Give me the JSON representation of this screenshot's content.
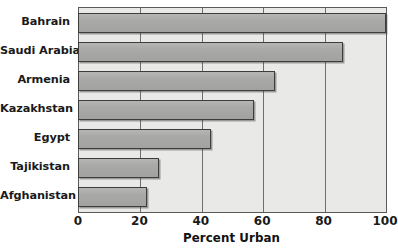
{
  "chart_data": {
    "type": "bar",
    "orientation": "horizontal",
    "title": "",
    "xlabel": "Percent Urban",
    "ylabel": "",
    "categories": [
      "Bahrain",
      "Saudi Arabia",
      "Armenia",
      "Kazakhstan",
      "Egypt",
      "Tajikistan",
      "Afghanistan"
    ],
    "values": [
      100,
      86,
      64,
      57,
      43,
      26,
      22
    ],
    "xlim": [
      0,
      100
    ],
    "xticks": [
      0,
      20,
      40,
      60,
      80,
      100
    ],
    "xtick_labels": [
      "0",
      "20",
      "40",
      "60",
      "80",
      "100"
    ],
    "grid": true,
    "grid_axis": "x",
    "legend": false,
    "bar_color": "#a9a9a7",
    "bar_edge_color": "#3d3d3b",
    "plot_background": "#e9e9e7",
    "axis_color": "#5a5a58",
    "text_color": "#1a1a1a"
  },
  "axis": {
    "x_title": "Percent Urban",
    "ticks": [
      {
        "label": "0",
        "value": 0
      },
      {
        "label": "20",
        "value": 20
      },
      {
        "label": "40",
        "value": 40
      },
      {
        "label": "60",
        "value": 60
      },
      {
        "label": "80",
        "value": 80
      },
      {
        "label": "100",
        "value": 100
      }
    ]
  },
  "bars": [
    {
      "label": "Bahrain",
      "value": 100
    },
    {
      "label": "Saudi Arabia",
      "value": 86
    },
    {
      "label": "Armenia",
      "value": 64
    },
    {
      "label": "Kazakhstan",
      "value": 57
    },
    {
      "label": "Egypt",
      "value": 43
    },
    {
      "label": "Tajikistan",
      "value": 26
    },
    {
      "label": "Afghanistan",
      "value": 22
    }
  ]
}
